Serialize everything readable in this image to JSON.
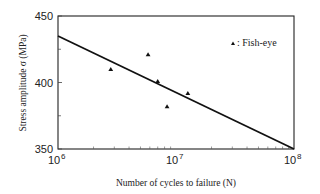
{
  "chart_data": {
    "type": "scatter",
    "title": "",
    "xlabel": "Number of cycles to failure (N)",
    "ylabel": "Stress amplitude σ (MPa)",
    "xscale": "log",
    "xlim": [
      1000000,
      100000000
    ],
    "ylim": [
      350,
      450
    ],
    "x_ticks": [
      {
        "value": 1000000,
        "base": "10",
        "exp": "6"
      },
      {
        "value": 10000000,
        "base": "10",
        "exp": "7"
      },
      {
        "value": 100000000,
        "base": "10",
        "exp": "8"
      }
    ],
    "y_ticks": [
      {
        "value": 450,
        "label": "450"
      },
      {
        "value": 400,
        "label": "400"
      },
      {
        "value": 350,
        "label": "350"
      }
    ],
    "y_minor_ticks": [
      425,
      375
    ],
    "grid": false,
    "series": [
      {
        "name": "Fish-eye",
        "marker": "triangle",
        "color": "#111111",
        "points": [
          {
            "x": 2800000,
            "y": 410
          },
          {
            "x": 5800000,
            "y": 421
          },
          {
            "x": 7000000,
            "y": 401
          },
          {
            "x": 8400000,
            "y": 382
          },
          {
            "x": 12600000,
            "y": 392
          }
        ]
      }
    ],
    "fit_line": {
      "name": "S-N fit",
      "color": "#111111",
      "points": [
        {
          "x": 1000000,
          "y": 435
        },
        {
          "x": 100000000,
          "y": 350
        }
      ]
    },
    "legend": {
      "placement": "top-right",
      "marker": "triangle",
      "text": ": Fish-eye"
    }
  }
}
